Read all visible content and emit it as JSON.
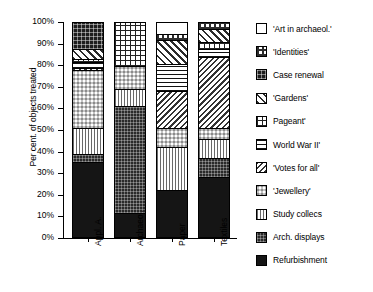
{
  "chart_data": {
    "type": "bar",
    "subtype": "stacked-100-percent",
    "title": "",
    "xlabel": "",
    "ylabel": "Per cent. of objects treated",
    "ylim": [
      0,
      100
    ],
    "ytick_labels": [
      "100%",
      "90%",
      "80%",
      "70%",
      "60%",
      "50%",
      "40%",
      "30%",
      "20%",
      "10%",
      "0%"
    ],
    "ytick_values": [
      100,
      90,
      80,
      70,
      60,
      50,
      40,
      30,
      20,
      10,
      0
    ],
    "grid": false,
    "legend_position": "right",
    "categories": [
      "Appl. A.",
      "Archaeol.",
      "Paper",
      "Textiles"
    ],
    "series": [
      {
        "name": "Refurbishment",
        "pattern": "solid-black",
        "values": [
          35,
          11,
          22,
          28
        ]
      },
      {
        "name": "Arch. displays",
        "pattern": "dark-fine-checker",
        "values": [
          4,
          50,
          0,
          9
        ]
      },
      {
        "name": "Study collecs",
        "pattern": "vertical-lines-light",
        "values": [
          12,
          8,
          20,
          9
        ]
      },
      {
        "name": "'Jewellery'",
        "pattern": "dense-checker",
        "values": [
          27,
          11,
          9,
          5
        ]
      },
      {
        "name": "'Votes for all'",
        "pattern": "back-diagonal-fine",
        "values": [
          1,
          0,
          17,
          33
        ]
      },
      {
        "name": "World War II'",
        "pattern": "horizontal-lines",
        "values": [
          3,
          0,
          13,
          4
        ]
      },
      {
        "name": "Pageant'",
        "pattern": "grid-cross",
        "values": [
          1,
          20,
          0,
          3
        ]
      },
      {
        "name": "'Gardens'",
        "pattern": "forward-diagonal",
        "values": [
          5,
          0,
          11,
          6
        ]
      },
      {
        "name": "Case renewal",
        "pattern": "dark-grid",
        "values": [
          12,
          0,
          0,
          0
        ]
      },
      {
        "name": "'Identities'",
        "pattern": "medium-checker",
        "values": [
          0,
          0,
          3,
          3
        ]
      },
      {
        "name": "'Art in archaeol.'",
        "pattern": "empty-white",
        "values": [
          0,
          0,
          5,
          0
        ]
      }
    ],
    "legend_order_top_to_bottom": [
      "'Art in archaeol.'",
      "'Identities'",
      "Case renewal",
      "'Gardens'",
      "Pageant'",
      "World War II'",
      "'Votes for all'",
      "'Jewellery'",
      "Study collecs",
      "Arch. displays",
      "Refurbishment"
    ]
  },
  "axis": {
    "y_title": "Per cent. of objects treated"
  },
  "colors": {
    "background": "#ffffff",
    "foreground": "#000000",
    "refurbishment": "#151515",
    "arch_displays": "#2a2a2a",
    "case_renewal": "#1e1e1e"
  }
}
